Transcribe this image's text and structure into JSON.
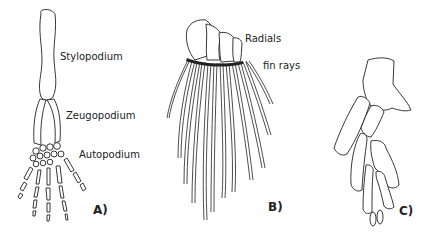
{
  "figure": {
    "panels": [
      {
        "id": "A",
        "panel_label": "A)",
        "subject": "tetrapod limb",
        "labels": [
          "Stylopodium",
          "Zeugopodium",
          "Autopodium"
        ]
      },
      {
        "id": "B",
        "panel_label": "B)",
        "subject": "fish fin",
        "labels": [
          "Radials",
          "fin rays"
        ]
      },
      {
        "id": "C",
        "panel_label": "C)",
        "subject": "fin/limb skeleton",
        "labels": []
      }
    ],
    "colors": {
      "background": "#ffffff",
      "line": "#222222"
    }
  }
}
